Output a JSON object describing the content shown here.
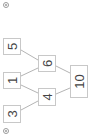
{
  "diagram": {
    "type": "number-pyramid",
    "orientation": "rotated-90-ccw",
    "colors": {
      "box_border": "#c8c8c8",
      "edge": "#b4b4b4",
      "text": "#444444",
      "background": "#ffffff"
    },
    "nodes": [
      {
        "id": "n5",
        "label": "5",
        "x": 3,
        "y": 38,
        "w": 18,
        "h": 17
      },
      {
        "id": "n1",
        "label": "1",
        "x": 3,
        "y": 72,
        "w": 18,
        "h": 17
      },
      {
        "id": "n3",
        "label": "3",
        "x": 3,
        "y": 105,
        "w": 18,
        "h": 18
      },
      {
        "id": "n6",
        "label": "6",
        "x": 38,
        "y": 55,
        "w": 18,
        "h": 17
      },
      {
        "id": "n4",
        "label": "4",
        "x": 38,
        "y": 88,
        "w": 18,
        "h": 18
      },
      {
        "id": "n10",
        "label": "10",
        "x": 70,
        "y": 65,
        "w": 18,
        "h": 33
      }
    ],
    "edges": [
      {
        "from": "n5",
        "to": "n6"
      },
      {
        "from": "n1",
        "to": "n6"
      },
      {
        "from": "n1",
        "to": "n4"
      },
      {
        "from": "n3",
        "to": "n4"
      },
      {
        "from": "n6",
        "to": "n10"
      },
      {
        "from": "n4",
        "to": "n10"
      }
    ],
    "markers": [
      {
        "name": "top-marker",
        "cx": 6,
        "cy": 5
      },
      {
        "name": "bottom-marker",
        "cx": 6,
        "cy": 131
      }
    ]
  }
}
